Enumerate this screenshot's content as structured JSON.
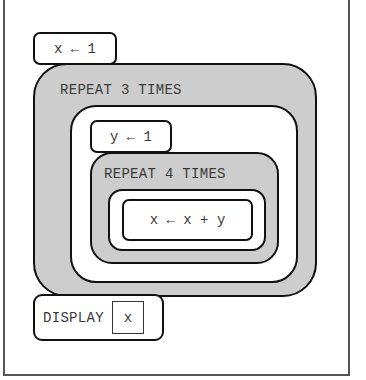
{
  "diagram": {
    "statement_1": "x ← 1",
    "repeat_outer": {
      "label": "REPEAT 3 TIMES",
      "statement": "y ← 1",
      "repeat_inner": {
        "label": "REPEAT 4 TIMES",
        "statement": "x ← x + y"
      }
    },
    "display": {
      "label": "DISPLAY",
      "argument": "x"
    },
    "colors": {
      "repeat_fill": "#cdcdcd",
      "block_fill": "#ffffff",
      "outline": "#111111",
      "text": "#3a3a3a"
    }
  }
}
